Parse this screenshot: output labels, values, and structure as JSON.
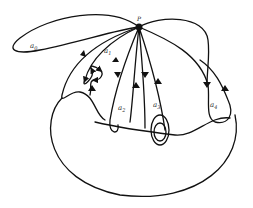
{
  "diagram": {
    "point": {
      "label": "P",
      "x": 139,
      "y": 27
    },
    "loops": [
      {
        "label": "a",
        "subscript": "0",
        "x": 30,
        "y": 46
      },
      {
        "label": "a",
        "subscript": "1",
        "x": 104,
        "y": 52
      },
      {
        "label": "a",
        "subscript": "2",
        "x": 118,
        "y": 111
      },
      {
        "label": "a",
        "subscript": "3",
        "x": 153,
        "y": 108
      },
      {
        "label": "a",
        "subscript": "4",
        "x": 210,
        "y": 108
      }
    ],
    "stroke_color": "#111111",
    "background": "#ffffff"
  }
}
